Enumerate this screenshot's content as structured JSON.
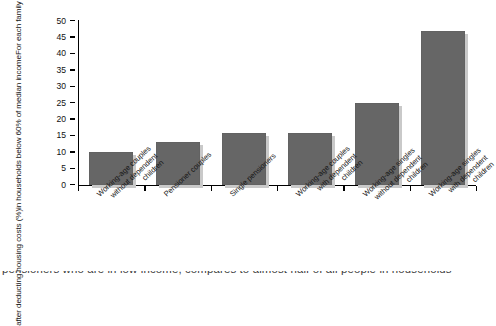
{
  "chart_data": {
    "type": "bar",
    "title": "",
    "xlabel": "",
    "ylabel": "For each family type, proportion of the population in households below 60% of median income after deducting housing costs (%)",
    "ylabel_lines": [
      "For each family type, proportion of the population",
      "in households below 60% of median income",
      "after deducting housing costs (%)"
    ],
    "categories": [
      "Working-age couples without dependent children",
      "Pensioner couples",
      "Single pensioners",
      "Working-age couples with dependent children",
      "Working-age singles without dependent children",
      "Working-age singles with dependent children"
    ],
    "category_lines": [
      [
        "Working-age couples",
        "without dependent",
        "children"
      ],
      [
        "Pensioner couples"
      ],
      [
        "Single pensioners"
      ],
      [
        "Working-age couples",
        "with dependent",
        "children"
      ],
      [
        "Working-age singles",
        "without dependent",
        "children"
      ],
      [
        "Working-age singles",
        "with dependent",
        "children"
      ]
    ],
    "values": [
      10,
      13,
      16,
      16,
      25,
      47
    ],
    "ylim": [
      0,
      50
    ],
    "yticks": [
      50,
      45,
      40,
      35,
      30,
      25,
      20,
      15,
      10,
      5,
      0
    ],
    "ytick_labels": [
      "50",
      "45",
      "40",
      "35",
      "30",
      "25",
      "20",
      "15",
      "10",
      "5",
      "0"
    ],
    "grid": false,
    "legend": false,
    "bar_color": "#666666",
    "axis_color": "#000000"
  },
  "caption": {
    "clipped_line": "pensioners who are in low income, compares to almost half of all people in households"
  }
}
